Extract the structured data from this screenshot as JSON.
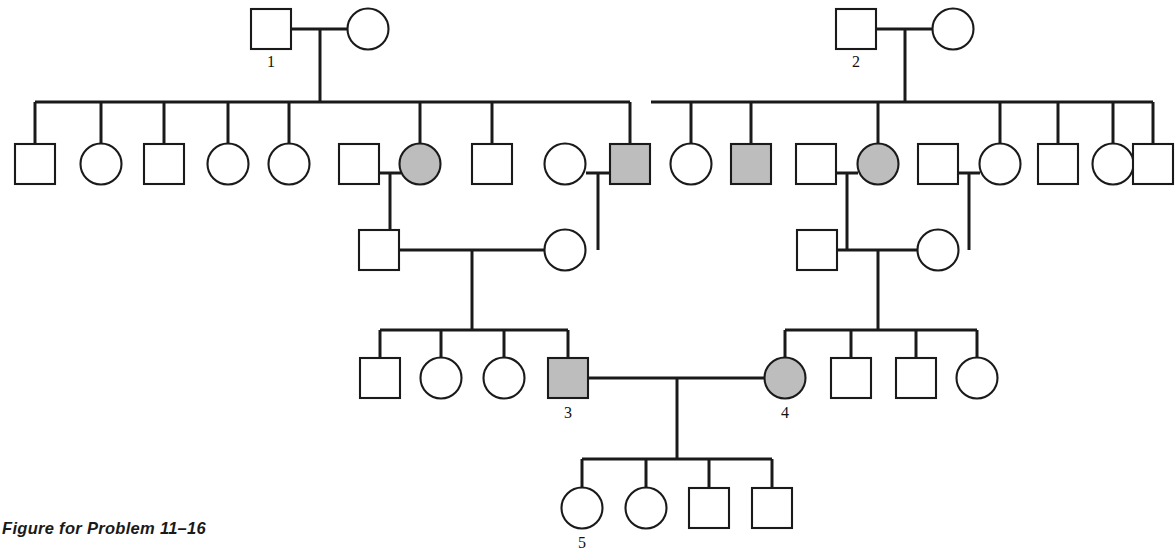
{
  "figure": {
    "caption": "Figure for Problem 11–16",
    "width": 1176,
    "height": 551,
    "background_color": "#ffffff",
    "line_color": "#1a1a1a",
    "unaffected_fill": "#ffffff",
    "affected_fill": "#bdbdbd"
  },
  "legend": {
    "square_meaning": "male",
    "circle_meaning": "female",
    "shaded_meaning": "affected",
    "unshaded_meaning": "unaffected"
  },
  "chart_data": {
    "type": "diagram",
    "diagram_kind": "pedigree",
    "title": "Figure for Problem 11–16",
    "generations": 5,
    "labeled_individuals": [
      "1",
      "2",
      "3",
      "4",
      "5"
    ],
    "counts": {
      "total_individuals": 45,
      "affected_individuals": 6,
      "affected_males": 3,
      "affected_females": 3
    },
    "individuals": [
      {
        "id": "I-1",
        "sex": "male",
        "affected": false,
        "label": "1",
        "cx": 271,
        "cy": 29,
        "gen": 1
      },
      {
        "id": "I-2",
        "sex": "female",
        "affected": false,
        "label": "",
        "cx": 368,
        "cy": 29,
        "gen": 1
      },
      {
        "id": "I-3",
        "sex": "male",
        "affected": false,
        "label": "2",
        "cx": 856,
        "cy": 29,
        "gen": 1
      },
      {
        "id": "I-4",
        "sex": "female",
        "affected": false,
        "label": "",
        "cx": 953,
        "cy": 29,
        "gen": 1
      },
      {
        "id": "II-1",
        "sex": "male",
        "affected": false,
        "label": "",
        "cx": 35,
        "cy": 164,
        "gen": 2
      },
      {
        "id": "II-2",
        "sex": "female",
        "affected": false,
        "label": "",
        "cx": 101,
        "cy": 164,
        "gen": 2
      },
      {
        "id": "II-3",
        "sex": "male",
        "affected": false,
        "label": "",
        "cx": 164,
        "cy": 164,
        "gen": 2
      },
      {
        "id": "II-4",
        "sex": "female",
        "affected": false,
        "label": "",
        "cx": 228,
        "cy": 164,
        "gen": 2
      },
      {
        "id": "II-5",
        "sex": "female",
        "affected": false,
        "label": "",
        "cx": 289,
        "cy": 164,
        "gen": 2
      },
      {
        "id": "II-6",
        "sex": "male",
        "affected": false,
        "label": "",
        "cx": 359,
        "cy": 164,
        "gen": 2
      },
      {
        "id": "II-7",
        "sex": "female",
        "affected": true,
        "label": "",
        "cx": 420,
        "cy": 164,
        "gen": 2
      },
      {
        "id": "II-8",
        "sex": "male",
        "affected": false,
        "label": "",
        "cx": 492,
        "cy": 164,
        "gen": 2
      },
      {
        "id": "II-9",
        "sex": "female",
        "affected": false,
        "label": "",
        "cx": 565,
        "cy": 164,
        "gen": 2
      },
      {
        "id": "II-10",
        "sex": "male",
        "affected": true,
        "label": "",
        "cx": 630,
        "cy": 164,
        "gen": 2
      },
      {
        "id": "II-11",
        "sex": "female",
        "affected": false,
        "label": "",
        "cx": 691,
        "cy": 164,
        "gen": 2
      },
      {
        "id": "II-12",
        "sex": "male",
        "affected": true,
        "label": "",
        "cx": 751,
        "cy": 164,
        "gen": 2
      },
      {
        "id": "II-13",
        "sex": "male",
        "affected": false,
        "label": "",
        "cx": 816,
        "cy": 164,
        "gen": 2
      },
      {
        "id": "II-14",
        "sex": "female",
        "affected": true,
        "label": "",
        "cx": 878,
        "cy": 164,
        "gen": 2
      },
      {
        "id": "II-15",
        "sex": "male",
        "affected": false,
        "label": "",
        "cx": 938,
        "cy": 164,
        "gen": 2
      },
      {
        "id": "II-16",
        "sex": "female",
        "affected": false,
        "label": "",
        "cx": 1000,
        "cy": 164,
        "gen": 2
      },
      {
        "id": "II-17",
        "sex": "male",
        "affected": false,
        "label": "",
        "cx": 1058,
        "cy": 164,
        "gen": 2
      },
      {
        "id": "II-18",
        "sex": "female",
        "affected": false,
        "label": "",
        "cx": 1113,
        "cy": 164,
        "gen": 2
      },
      {
        "id": "II-19",
        "sex": "male",
        "affected": false,
        "label": "",
        "cx": 1153,
        "cy": 164,
        "gen": 2
      },
      {
        "id": "III-1",
        "sex": "male",
        "affected": false,
        "label": "",
        "cx": 379,
        "cy": 250,
        "gen": 3
      },
      {
        "id": "III-2",
        "sex": "female",
        "affected": false,
        "label": "",
        "cx": 565,
        "cy": 250,
        "gen": 3
      },
      {
        "id": "III-3",
        "sex": "male",
        "affected": false,
        "label": "",
        "cx": 817,
        "cy": 250,
        "gen": 3
      },
      {
        "id": "III-4",
        "sex": "female",
        "affected": false,
        "label": "",
        "cx": 938,
        "cy": 250,
        "gen": 3
      },
      {
        "id": "IV-1",
        "sex": "male",
        "affected": false,
        "label": "",
        "cx": 380,
        "cy": 378,
        "gen": 4
      },
      {
        "id": "IV-2",
        "sex": "female",
        "affected": false,
        "label": "",
        "cx": 441,
        "cy": 378,
        "gen": 4
      },
      {
        "id": "IV-3",
        "sex": "female",
        "affected": false,
        "label": "",
        "cx": 504,
        "cy": 378,
        "gen": 4
      },
      {
        "id": "IV-4",
        "sex": "male",
        "affected": true,
        "label": "3",
        "cx": 568,
        "cy": 378,
        "gen": 4
      },
      {
        "id": "IV-5",
        "sex": "female",
        "affected": true,
        "label": "4",
        "cx": 785,
        "cy": 378,
        "gen": 4
      },
      {
        "id": "IV-6",
        "sex": "male",
        "affected": false,
        "label": "",
        "cx": 851,
        "cy": 378,
        "gen": 4
      },
      {
        "id": "IV-7",
        "sex": "male",
        "affected": false,
        "label": "",
        "cx": 916,
        "cy": 378,
        "gen": 4
      },
      {
        "id": "IV-8",
        "sex": "female",
        "affected": false,
        "label": "",
        "cx": 977,
        "cy": 378,
        "gen": 4
      },
      {
        "id": "V-1",
        "sex": "female",
        "affected": false,
        "label": "5",
        "cx": 582,
        "cy": 508,
        "gen": 5
      },
      {
        "id": "V-2",
        "sex": "female",
        "affected": false,
        "label": "",
        "cx": 646,
        "cy": 508,
        "gen": 5
      },
      {
        "id": "V-3",
        "sex": "male",
        "affected": false,
        "label": "",
        "cx": 709,
        "cy": 508,
        "gen": 5
      },
      {
        "id": "V-4",
        "sex": "male",
        "affected": false,
        "label": "",
        "cx": 772,
        "cy": 508,
        "gen": 5
      }
    ],
    "matings": [
      {
        "partners": [
          "I-1",
          "I-2"
        ],
        "children": [
          "II-1",
          "II-2",
          "II-3",
          "II-4",
          "II-5",
          "II-6",
          "II-7",
          "II-8",
          "II-9",
          "II-10"
        ]
      },
      {
        "partners": [
          "I-3",
          "I-4"
        ],
        "children": [
          "II-11",
          "II-12",
          "II-14",
          "II-16",
          "II-17",
          "II-18",
          "II-19"
        ]
      },
      {
        "partners": [
          "II-6",
          "II-7"
        ],
        "children": [
          "III-1"
        ]
      },
      {
        "partners": [
          "II-9",
          "II-10"
        ],
        "children": [
          "III-2"
        ]
      },
      {
        "partners": [
          "II-13",
          "II-14"
        ],
        "children": [
          "III-3"
        ]
      },
      {
        "partners": [
          "II-15",
          "II-16"
        ],
        "children": [
          "III-4"
        ]
      },
      {
        "partners": [
          "III-1",
          "III-2"
        ],
        "children": [
          "IV-1",
          "IV-2",
          "IV-3",
          "IV-4"
        ]
      },
      {
        "partners": [
          "III-3",
          "III-4"
        ],
        "children": [
          "IV-5",
          "IV-6",
          "IV-7",
          "IV-8"
        ]
      },
      {
        "partners": [
          "IV-4",
          "IV-5"
        ],
        "children": [
          "V-1",
          "V-2",
          "V-3",
          "V-4"
        ]
      }
    ],
    "connector_lines": [
      {
        "name": "couple1-bar",
        "x1": 291,
        "y1": 29,
        "x2": 348,
        "y2": 29
      },
      {
        "name": "couple1-drop",
        "x1": 320,
        "y1": 29,
        "x2": 320,
        "y2": 102
      },
      {
        "name": "sibship1-bar",
        "x1": 35,
        "y1": 102,
        "x2": 630,
        "y2": 102
      },
      {
        "name": "couple2-bar",
        "x1": 876,
        "y1": 29,
        "x2": 933,
        "y2": 29
      },
      {
        "name": "couple2-drop",
        "x1": 905,
        "y1": 29,
        "x2": 905,
        "y2": 102
      },
      {
        "name": "sibship2-bar",
        "x1": 651,
        "y1": 102,
        "x2": 1153,
        "y2": 102
      },
      {
        "name": "drop-II-1",
        "x1": 35,
        "y1": 102,
        "x2": 35,
        "y2": 143
      },
      {
        "name": "drop-II-2",
        "x1": 101,
        "y1": 102,
        "x2": 101,
        "y2": 145
      },
      {
        "name": "drop-II-3",
        "x1": 164,
        "y1": 102,
        "x2": 164,
        "y2": 143
      },
      {
        "name": "drop-II-4",
        "x1": 228,
        "y1": 102,
        "x2": 228,
        "y2": 145
      },
      {
        "name": "drop-II-5",
        "x1": 289,
        "y1": 102,
        "x2": 289,
        "y2": 145
      },
      {
        "name": "drop-II-7",
        "x1": 420,
        "y1": 102,
        "x2": 420,
        "y2": 145
      },
      {
        "name": "drop-II-8",
        "x1": 492,
        "y1": 102,
        "x2": 492,
        "y2": 143
      },
      {
        "name": "drop-II-10",
        "x1": 630,
        "y1": 102,
        "x2": 630,
        "y2": 143
      },
      {
        "name": "drop-II-11",
        "x1": 691,
        "y1": 102,
        "x2": 691,
        "y2": 145
      },
      {
        "name": "drop-II-12",
        "x1": 751,
        "y1": 102,
        "x2": 751,
        "y2": 143
      },
      {
        "name": "drop-II-14",
        "x1": 878,
        "y1": 102,
        "x2": 878,
        "y2": 145
      },
      {
        "name": "drop-II-16",
        "x1": 1000,
        "y1": 102,
        "x2": 1000,
        "y2": 145
      },
      {
        "name": "drop-II-17",
        "x1": 1058,
        "y1": 102,
        "x2": 1058,
        "y2": 143
      },
      {
        "name": "drop-II-18",
        "x1": 1113,
        "y1": 102,
        "x2": 1113,
        "y2": 145
      },
      {
        "name": "drop-II-19",
        "x1": 1153,
        "y1": 102,
        "x2": 1153,
        "y2": 143
      },
      {
        "name": "mate-II6-II7",
        "x1": 379,
        "y1": 173,
        "x2": 401,
        "y2": 173
      },
      {
        "name": "mate-II6-II7-drop",
        "x1": 390,
        "y1": 173,
        "x2": 390,
        "y2": 250
      },
      {
        "name": "mate-II9-II10",
        "x1": 586,
        "y1": 173,
        "x2": 610,
        "y2": 173
      },
      {
        "name": "mate-II9-II10-drop",
        "x1": 598,
        "y1": 173,
        "x2": 598,
        "y2": 250
      },
      {
        "name": "mate-II13-II14",
        "x1": 836,
        "y1": 173,
        "x2": 858,
        "y2": 173
      },
      {
        "name": "mate-II13-II14-drop",
        "x1": 847,
        "y1": 173,
        "x2": 847,
        "y2": 250
      },
      {
        "name": "mate-II15-II16",
        "x1": 958,
        "y1": 173,
        "x2": 980,
        "y2": 173
      },
      {
        "name": "mate-II15-II16-drop",
        "x1": 969,
        "y1": 173,
        "x2": 969,
        "y2": 250
      },
      {
        "name": "stub-III1-up",
        "x1": 390,
        "y1": 230,
        "x2": 390,
        "y2": 231
      },
      {
        "name": "mate-III-left-bar",
        "x1": 399,
        "y1": 250,
        "x2": 545,
        "y2": 250
      },
      {
        "name": "mate-III-left-drop",
        "x1": 472,
        "y1": 250,
        "x2": 472,
        "y2": 330
      },
      {
        "name": "sibship-IV-left",
        "x1": 380,
        "y1": 330,
        "x2": 568,
        "y2": 330
      },
      {
        "name": "mate-III-right-bar",
        "x1": 837,
        "y1": 250,
        "x2": 918,
        "y2": 250
      },
      {
        "name": "mate-III-right-drop",
        "x1": 878,
        "y1": 250,
        "x2": 878,
        "y2": 330
      },
      {
        "name": "sibship-IV-right",
        "x1": 785,
        "y1": 330,
        "x2": 977,
        "y2": 330
      },
      {
        "name": "drop-IV-1",
        "x1": 380,
        "y1": 330,
        "x2": 380,
        "y2": 357
      },
      {
        "name": "drop-IV-2",
        "x1": 441,
        "y1": 330,
        "x2": 441,
        "y2": 359
      },
      {
        "name": "drop-IV-3",
        "x1": 504,
        "y1": 330,
        "x2": 504,
        "y2": 359
      },
      {
        "name": "drop-IV-4",
        "x1": 568,
        "y1": 330,
        "x2": 568,
        "y2": 357
      },
      {
        "name": "drop-IV-5",
        "x1": 785,
        "y1": 330,
        "x2": 785,
        "y2": 359
      },
      {
        "name": "drop-IV-6",
        "x1": 851,
        "y1": 330,
        "x2": 851,
        "y2": 357
      },
      {
        "name": "drop-IV-7",
        "x1": 916,
        "y1": 330,
        "x2": 916,
        "y2": 357
      },
      {
        "name": "drop-IV-8",
        "x1": 977,
        "y1": 330,
        "x2": 977,
        "y2": 359
      },
      {
        "name": "mate-IV4-IV5-bar",
        "x1": 588,
        "y1": 378,
        "x2": 765,
        "y2": 378
      },
      {
        "name": "mate-IV4-IV5-drop",
        "x1": 677,
        "y1": 378,
        "x2": 677,
        "y2": 459
      },
      {
        "name": "sibship-V",
        "x1": 582,
        "y1": 459,
        "x2": 772,
        "y2": 459
      },
      {
        "name": "drop-V-1",
        "x1": 582,
        "y1": 459,
        "x2": 582,
        "y2": 489
      },
      {
        "name": "drop-V-2",
        "x1": 646,
        "y1": 459,
        "x2": 646,
        "y2": 489
      },
      {
        "name": "drop-V-3",
        "x1": 709,
        "y1": 459,
        "x2": 709,
        "y2": 487
      },
      {
        "name": "drop-V-4",
        "x1": 772,
        "y1": 459,
        "x2": 772,
        "y2": 487
      }
    ],
    "symbol_sizes": {
      "square_side": 40,
      "circle_radius": 20.5
    },
    "label_offsets": {
      "gen1_dy": 30,
      "gen4_dy": 32,
      "gen5_dy": 32
    }
  }
}
